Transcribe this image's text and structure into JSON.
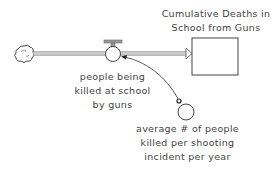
{
  "diagram": {
    "type": "stock-and-flow",
    "colors": {
      "stroke": "#444444",
      "pipe": "#888888",
      "text": "#444444",
      "background": "#ffffff"
    },
    "source": {
      "icon": "cloud-icon"
    },
    "flow": {
      "label_lines": [
        "people being",
        "killed at school",
        "by guns"
      ]
    },
    "stock": {
      "label_lines": [
        "Cumulative Deaths in",
        "School from Guns"
      ]
    },
    "auxiliary": {
      "label_lines": [
        "average # of people",
        "killed per shooting",
        "incident per year"
      ]
    }
  }
}
